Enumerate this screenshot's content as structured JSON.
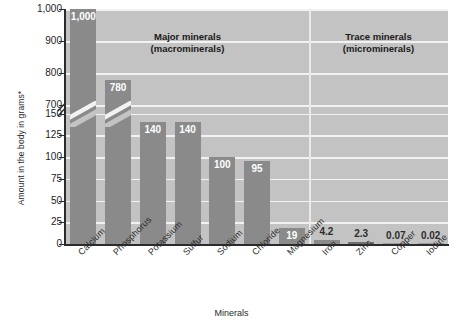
{
  "chart_data": {
    "type": "bar",
    "title": "",
    "xlabel": "Minerals",
    "ylabel": "Amount in the body in grams*",
    "categories": [
      "Calcium",
      "Phosphorus",
      "Potassium",
      "Sulfur",
      "Sodium",
      "Chloride",
      "Magnesium",
      "Iron",
      "Zinc",
      "Copper",
      "Iodine"
    ],
    "values": [
      1000,
      780,
      140,
      140,
      100,
      95,
      19,
      4.2,
      2.3,
      0.07,
      0.02
    ],
    "value_labels": [
      "1,000",
      "780",
      "140",
      "140",
      "100",
      "95",
      "19",
      "4.2",
      "2.3",
      "0.07",
      "0.02"
    ],
    "ytick_labels": [
      "0",
      "25",
      "50",
      "75",
      "100",
      "125",
      "150",
      "700",
      "800",
      "900",
      "1,000"
    ],
    "ytick_values": [
      0,
      25,
      50,
      75,
      100,
      125,
      150,
      700,
      800,
      900,
      1000
    ],
    "axis_break": {
      "present": true,
      "between": [
        150,
        700
      ],
      "note": "broken y-axis"
    },
    "ylim": [
      0,
      1000
    ],
    "grid": true,
    "legend": "none",
    "groups": [
      {
        "label_line1": "Major minerals",
        "label_line2": "(macrominerals)",
        "categories": [
          "Calcium",
          "Phosphorus",
          "Potassium",
          "Sulfur",
          "Sodium",
          "Chloride",
          "Magnesium"
        ]
      },
      {
        "label_line1": "Trace minerals",
        "label_line2": "(microminerals)",
        "categories": [
          "Iron",
          "Zinc",
          "Copper",
          "Iodine"
        ]
      }
    ],
    "colors": {
      "bar": "#8a8a8a",
      "plot_background": "#c3c3c3",
      "gridline": "#f2f2f2",
      "axis": "#2b2b2b",
      "value_label_inside": "#ffffff",
      "value_label_outside": "#2c2c2c"
    }
  }
}
